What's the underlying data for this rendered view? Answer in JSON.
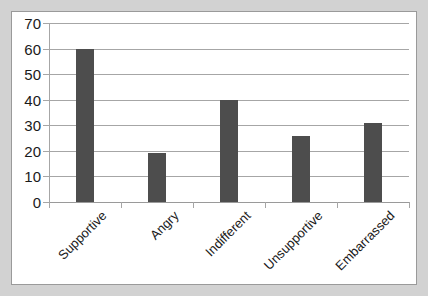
{
  "chart_data": {
    "type": "bar",
    "title": "",
    "subtitle": "",
    "xlabel": "",
    "ylabel": "",
    "categories": [
      "Supportive",
      "Angry",
      "Indifferent",
      "Unsupportive",
      "Embarrassed"
    ],
    "values": [
      60,
      19,
      40,
      26,
      31
    ],
    "series": [
      {
        "name": "",
        "values": [
          60,
          19,
          40,
          26,
          31
        ]
      }
    ],
    "ylim": [
      0,
      70
    ],
    "y_ticks": [
      0,
      10,
      20,
      30,
      40,
      50,
      60,
      70
    ],
    "y_tick_labels": [
      "0",
      "10",
      "20",
      "30",
      "40",
      "50",
      "60",
      "70"
    ],
    "grid": true,
    "grid_axis": "y",
    "legend": false,
    "legend_position": "none",
    "bar_color": "#4d4d4d",
    "gridline_color": "#a6a6a6",
    "axis_color": "#a6a6a6",
    "plot_background": "#ffffff",
    "page_background": "#d2d2d2",
    "panel_border_color": "#9a9a9a",
    "x_tick_label_rotation": -45,
    "annotations": []
  }
}
